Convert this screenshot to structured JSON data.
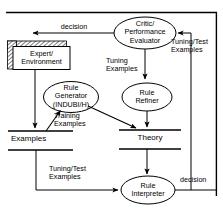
{
  "diagram": {
    "background_color": "#ffffff",
    "stroke_color": "#000000",
    "nodes": {
      "critic": {
        "label": "Critic/\nPerformance\nEvaluator",
        "shape": "ellipse"
      },
      "expert": {
        "label": "Expert/\nEnvironment",
        "shape": "box-shadowed"
      },
      "rule_generator": {
        "label": "Rule\nGenerator\n(INDUBI/H)",
        "shape": "ellipse"
      },
      "rule_refiner": {
        "label": "Rule\nRefiner",
        "shape": "ellipse"
      },
      "rule_interpreter": {
        "label": "Rule\nInterpreter",
        "shape": "ellipse"
      },
      "examples_store": {
        "label": "Examples",
        "shape": "data-store"
      },
      "theory_store": {
        "label": "Theory",
        "shape": "data-store"
      }
    },
    "edge_labels": {
      "decision_top": "decision",
      "tuning_test_right": "Tuning/Test\nExamples",
      "tuning_examples": "Tuning\nExamples",
      "training_examples": "Training\nExamples",
      "tuning_test_bottom": "Tuning/Test\nExamples",
      "decision_bottom": "decision"
    }
  }
}
